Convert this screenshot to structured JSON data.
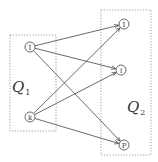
{
  "groups": [
    {
      "id": "Q1",
      "label": "Q",
      "subscript": "1",
      "box": {
        "x": 10,
        "y": 35,
        "w": 46,
        "h": 96
      },
      "label_pos": {
        "x": 12,
        "y": 92
      }
    },
    {
      "id": "Q2",
      "label": "Q",
      "subscript": "2",
      "box": {
        "x": 101,
        "y": 10,
        "w": 50,
        "h": 145
      },
      "label_pos": {
        "x": 127,
        "y": 112
      }
    }
  ],
  "nodes": [
    {
      "id": "L1",
      "label": "1",
      "x": 30,
      "y": 47
    },
    {
      "id": "Lk",
      "label": "k",
      "x": 30,
      "y": 117
    },
    {
      "id": "R1",
      "label": "1",
      "x": 124,
      "y": 24
    },
    {
      "id": "Ri",
      "label": "i",
      "x": 121,
      "y": 70
    },
    {
      "id": "Rp",
      "label": "P",
      "x": 124,
      "y": 145
    }
  ],
  "edges": [
    {
      "from": "L1",
      "to": "R1"
    },
    {
      "from": "L1",
      "to": "Ri"
    },
    {
      "from": "L1",
      "to": "Rp"
    },
    {
      "from": "Lk",
      "to": "R1"
    },
    {
      "from": "Lk",
      "to": "Ri"
    },
    {
      "from": "Lk",
      "to": "Rp"
    }
  ],
  "style": {
    "line_color": "#444444",
    "box_color": "#888888",
    "node_radius": 5
  }
}
